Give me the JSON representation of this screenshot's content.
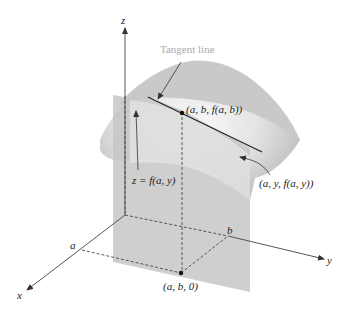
{
  "figure": {
    "axes": {
      "x_label": "x",
      "y_label": "y",
      "z_label": "z",
      "x_tick": "a",
      "y_tick": "b"
    },
    "annotations": {
      "tangent_line": "Tangent line",
      "point_top": "(a, b, f(a, b))",
      "curve_eq": "z = f(a, y)",
      "curve_point": "(a, y, f(a, y))",
      "base_point": "(a, b, 0)"
    },
    "colors": {
      "surface": "#c8c8c8",
      "surface_highlight": "#f2f2f2",
      "plane": "#c4c4c4",
      "axis": "#555555",
      "text": "#222222",
      "tangent_label": "#aaaaaa"
    }
  }
}
